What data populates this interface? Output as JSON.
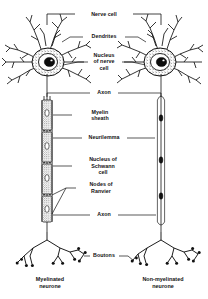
{
  "figure": {
    "background_color": "#ffffff",
    "ink_color": "#111111"
  },
  "labels": {
    "nerve_cell": "Nerve cell",
    "dendrites": "Dendrites",
    "nucleus_of_nerve_cell": [
      "Nucleus",
      "of nerve",
      "cell"
    ],
    "axon_upper": "Axon",
    "myelin_sheath": [
      "Myelin",
      "sheath"
    ],
    "neurilemma": "Neurilemma",
    "nucleus_of_schwann_cell": [
      "Nucleus of",
      "Schwann",
      "cell"
    ],
    "nodes_of_ranvier": [
      "Nodes of",
      "Ranvier"
    ],
    "axon_lower": "Axon",
    "boutons": "Boutons"
  },
  "captions": {
    "left": [
      "Myelinated",
      "neurone"
    ],
    "right": [
      "Non-myelinated",
      "neurone"
    ]
  },
  "structures": {
    "left_neurone": {
      "name": "Myelinated neurone",
      "parts": [
        "dendrites",
        "cell body",
        "nucleus",
        "axon",
        "myelin sheath",
        "neurilemma",
        "Schwann cell nucleus",
        "nodes of Ranvier",
        "boutons"
      ]
    },
    "right_neurone": {
      "name": "Non-myelinated neurone",
      "parts": [
        "dendrites",
        "cell body",
        "nucleus",
        "axon",
        "boutons"
      ]
    }
  }
}
